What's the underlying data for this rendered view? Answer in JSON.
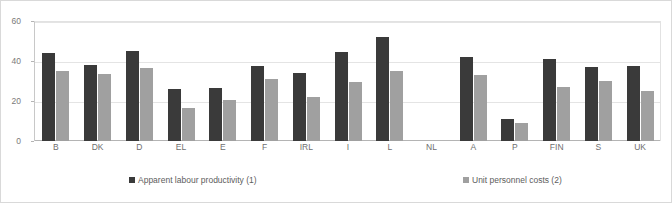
{
  "chart_data": {
    "type": "bar",
    "title": "",
    "subtitle": "",
    "xlabel": "",
    "ylabel": "",
    "ylim": [
      0,
      60
    ],
    "yticks": [
      0,
      20,
      40,
      60
    ],
    "grid": true,
    "legend_position": "bottom",
    "categories": [
      "B",
      "DK",
      "D",
      "EL",
      "E",
      "F",
      "IRL",
      "I",
      "L",
      "NL",
      "A",
      "P",
      "FIN",
      "S",
      "UK"
    ],
    "series": [
      {
        "name": "Apparent labour productivity (1)",
        "color": "#3a3a3a",
        "values": [
          44,
          38,
          45,
          26,
          26.5,
          37.5,
          34,
          44.5,
          52,
          null,
          42,
          11,
          41,
          37,
          37.5
        ]
      },
      {
        "name": "Unit personnel costs (2)",
        "color": "#a0a0a0",
        "values": [
          35,
          33.5,
          36.5,
          16.5,
          20.5,
          31,
          22,
          29.5,
          35,
          null,
          33,
          9,
          27,
          30,
          25
        ]
      }
    ]
  },
  "axis": {
    "y_tick_labels": [
      "0",
      "20",
      "40",
      "60"
    ]
  },
  "colors": {
    "series0": "#3a3a3a",
    "series1": "#a0a0a0",
    "gridline": "#e4e4e4",
    "axis": "#b4b4b4",
    "border": "#d9d9d9",
    "text": "#6e6e6e"
  }
}
